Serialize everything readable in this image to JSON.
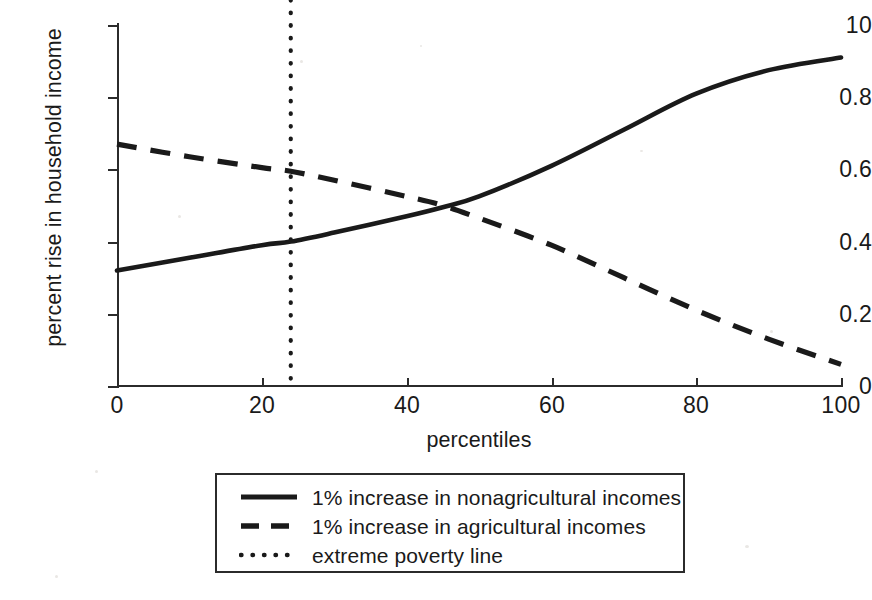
{
  "chart_data": {
    "type": "line",
    "title": "",
    "subtitle": "",
    "xlabel": "percentiles",
    "ylabel": "percent rise in household income",
    "xlim": [
      0,
      100
    ],
    "ylim": [
      0,
      1.0
    ],
    "grid": false,
    "legend_position": "bottom-center",
    "xticks": [
      "0",
      "20",
      "40",
      "60",
      "80",
      "100"
    ],
    "xtick_values": [
      0,
      20,
      40,
      60,
      80,
      100
    ],
    "yticks": [
      "0",
      "0.2",
      "0.4",
      "0.6",
      "0.8",
      "10"
    ],
    "ytick_values": [
      0,
      0.2,
      0.4,
      0.6,
      0.8,
      1.0
    ],
    "series": [
      {
        "name": "1% increase in nonagricultural incomes",
        "style": "solid",
        "color": "#1a1a1a",
        "x": [
          0,
          10,
          20,
          24,
          30,
          40,
          45,
          50,
          60,
          70,
          80,
          90,
          100
        ],
        "values": [
          0.32,
          0.355,
          0.39,
          0.4,
          0.425,
          0.47,
          0.495,
          0.525,
          0.61,
          0.71,
          0.81,
          0.875,
          0.91
        ]
      },
      {
        "name": "1% increase in agricultural incomes",
        "style": "dashed",
        "color": "#1a1a1a",
        "x": [
          0,
          10,
          20,
          24,
          30,
          40,
          45,
          50,
          60,
          70,
          80,
          90,
          100
        ],
        "values": [
          0.67,
          0.635,
          0.605,
          0.595,
          0.57,
          0.525,
          0.5,
          0.465,
          0.39,
          0.3,
          0.21,
          0.13,
          0.06
        ]
      }
    ],
    "annotations": [
      {
        "name": "extreme poverty line",
        "style": "dotted",
        "orientation": "vertical",
        "x": 24
      }
    ],
    "crossing_point": {
      "x": 45,
      "y": 0.5
    }
  },
  "legend": {
    "items": [
      {
        "label": "1% increase in nonagricultural incomes",
        "style": "solid"
      },
      {
        "label": "1% increase in agricultural incomes",
        "style": "dashed"
      },
      {
        "label": "extreme poverty line",
        "style": "dotted"
      }
    ]
  }
}
